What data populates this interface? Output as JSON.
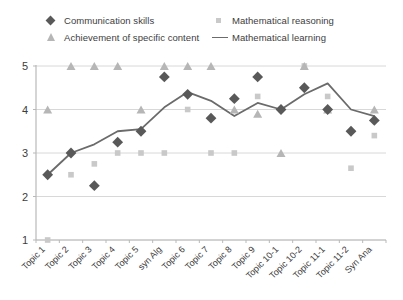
{
  "chart_data": {
    "type": "scatter",
    "title": "",
    "xlabel": "",
    "ylabel": "",
    "ylim": [
      1,
      5
    ],
    "yticks": [
      1,
      2,
      3,
      4,
      5
    ],
    "grid": true,
    "legend_position": "top",
    "categories": [
      "Topic 1",
      "Topic 2",
      "Topic 3",
      "Topic 4",
      "Topic 5",
      "syn Alg",
      "Topic 6",
      "Topic 7",
      "Topic 8",
      "Topic 9",
      "Topic 10-1",
      "Topic 10-2",
      "Topic 11-1",
      "Topic 11-2",
      "Syn Ana"
    ],
    "series": [
      {
        "name": "Communication skills",
        "marker": "diamond",
        "color": "#595959",
        "values": [
          2.5,
          3.0,
          2.25,
          3.25,
          3.5,
          4.75,
          4.35,
          3.8,
          4.25,
          4.75,
          4.0,
          4.5,
          4.0,
          3.5,
          3.75
        ]
      },
      {
        "name": "Mathematical reasoning",
        "marker": "square",
        "color": "#c9c9c9",
        "values": [
          1.0,
          2.5,
          2.75,
          3.0,
          3.0,
          3.0,
          4.0,
          3.0,
          3.0,
          4.3,
          4.0,
          5.0,
          4.3,
          2.65,
          3.4
        ]
      },
      {
        "name": "Achievement of specific content",
        "marker": "triangle",
        "color": "#b6b6b6",
        "values": [
          4.0,
          5.0,
          5.0,
          5.0,
          4.0,
          5.0,
          5.0,
          5.0,
          4.0,
          3.9,
          3.0,
          5.0,
          4.0,
          null,
          4.0
        ]
      },
      {
        "name": "Mathematical learning",
        "marker": "line",
        "color": "#6b6b6b",
        "values": [
          2.5,
          3.0,
          3.2,
          3.5,
          3.55,
          4.05,
          4.4,
          4.2,
          3.85,
          4.15,
          4.0,
          4.35,
          4.6,
          4.0,
          3.85
        ]
      }
    ]
  },
  "legend": {
    "items": [
      {
        "label": "Communication skills",
        "marker": "diamond-marker"
      },
      {
        "label": "Achievement of specific content",
        "marker": "triangle-marker"
      },
      {
        "label": "Mathematical reasoning",
        "marker": "square-marker"
      },
      {
        "label": "Mathematical learning",
        "marker": "line-marker"
      }
    ]
  }
}
